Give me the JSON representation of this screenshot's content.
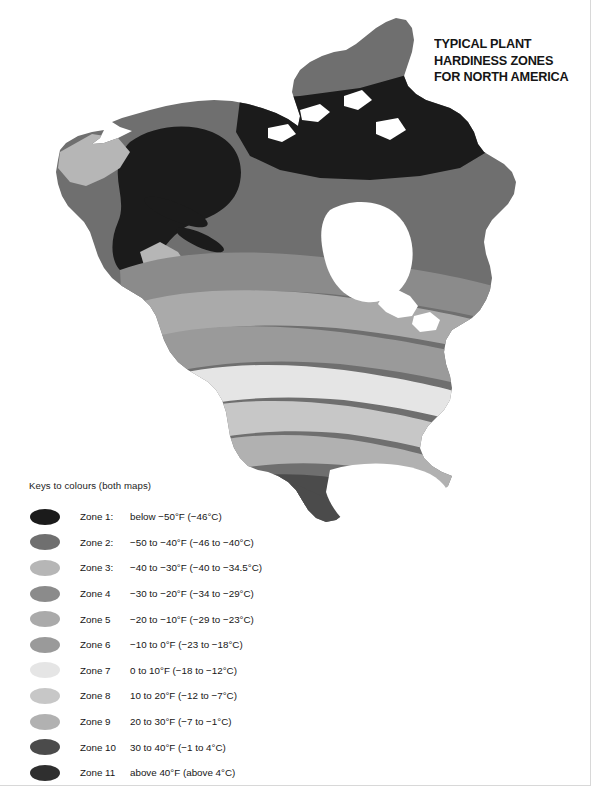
{
  "title": {
    "line1": "TYPICAL PLANT",
    "line2": "HARDINESS ZONES",
    "line3": "FOR NORTH AMERICA"
  },
  "legend": {
    "heading": "Keys to colours (both maps)",
    "rows": [
      {
        "zone": "Zone 1:",
        "range": "below −50°F (−46°C)",
        "color": "#1b1b1b"
      },
      {
        "zone": "Zone 2:",
        "range": "−50 to −40°F (−46 to −40°C)",
        "color": "#6f6f6f"
      },
      {
        "zone": "Zone 3:",
        "range": "−40 to −30°F (−40 to −34.5°C)",
        "color": "#b6b6b6"
      },
      {
        "zone": "Zone 4",
        "range": "−30 to −20°F (−34 to −29°C)",
        "color": "#8b8b8b"
      },
      {
        "zone": "Zone 5",
        "range": "−20 to −10°F (−29 to −23°C)",
        "color": "#aaaaaa"
      },
      {
        "zone": "Zone 6",
        "range": "−10 to 0°F (−23 to −18°C)",
        "color": "#9a9a9a"
      },
      {
        "zone": "Zone 7",
        "range": "0 to 10°F (−18 to −12°C)",
        "color": "#e5e5e5"
      },
      {
        "zone": "Zone 8",
        "range": "10 to 20°F (−12 to −7°C)",
        "color": "#c7c7c7"
      },
      {
        "zone": "Zone 9",
        "range": "20 to 30°F (−7 to −1°C)",
        "color": "#b1b1b1"
      },
      {
        "zone": "Zone 10",
        "range": "30 to 40°F (−1 to 4°C)",
        "color": "#4b4b4b"
      },
      {
        "zone": "Zone 11",
        "range": "above 40°F (above 4°C)",
        "color": "#2f2f2f"
      }
    ]
  },
  "map": {
    "region": "North America",
    "projection_note": "continental outline with hardiness zone bands",
    "water_color": "#ffffff",
    "background_color": "#ffffff"
  }
}
